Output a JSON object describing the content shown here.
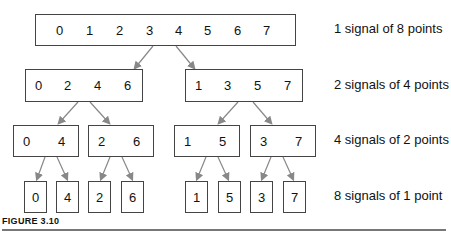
{
  "rows": [
    {
      "label": "1 signal of 8 points",
      "boxes": [
        [
          "0",
          "1",
          "2",
          "3",
          "4",
          "5",
          "6",
          "7"
        ]
      ]
    },
    {
      "label": "2 signals of 4 points",
      "boxes": [
        [
          "0",
          "2",
          "4",
          "6"
        ],
        [
          "1",
          "3",
          "5",
          "7"
        ]
      ]
    },
    {
      "label": "4 signals of 2 points",
      "boxes": [
        [
          "0",
          "4"
        ],
        [
          "2",
          "6"
        ],
        [
          "1",
          "5"
        ],
        [
          "3",
          "7"
        ]
      ]
    },
    {
      "label": "8 signals of 1 point",
      "boxes": [
        [
          "0"
        ],
        [
          "4"
        ],
        [
          "2"
        ],
        [
          "6"
        ],
        [
          "1"
        ],
        [
          "5"
        ],
        [
          "3"
        ],
        [
          "7"
        ]
      ]
    }
  ],
  "figure_caption": "FIGURE 3.10",
  "colors": {
    "arrow": "#888888",
    "border": "#444444"
  }
}
